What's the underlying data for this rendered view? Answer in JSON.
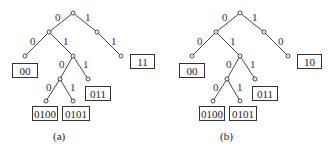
{
  "panels": [
    {
      "caption": "(a)",
      "edge_labels": {
        "root_left": "0",
        "root_right": "1",
        "l_left": "0",
        "l_right": "1",
        "r_right": "1",
        "lr_left": "0",
        "lr_right": "1",
        "lrl_left": "0",
        "lrl_right": "1"
      },
      "codewords": {
        "ll": "00",
        "rr": "11",
        "lrr": "011",
        "lrll": "0100",
        "lrlr": "0101"
      }
    },
    {
      "caption": "(b)",
      "edge_labels": {
        "root_left": "0",
        "root_right": "1",
        "l_left": "0",
        "l_right": "1",
        "r_right": "0",
        "lr_left": "0",
        "lr_right": "1",
        "lrl_left": "0",
        "lrl_right": "1"
      },
      "codewords": {
        "ll": "00",
        "rr": "10",
        "lrr": "011",
        "lrll": "0100",
        "lrlr": "0101"
      }
    }
  ]
}
